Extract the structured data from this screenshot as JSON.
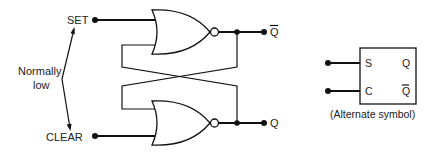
{
  "diagram": {
    "inputs": {
      "set_label": "SET",
      "clear_label": "CLEAR",
      "annotation": [
        "Normally",
        "low"
      ]
    },
    "outputs": {
      "q_bar_label": "Q",
      "q_label": "Q"
    },
    "gates": [
      {
        "type": "NOR",
        "position": "top",
        "inputs": [
          "SET",
          "Q"
        ],
        "output": "Q-bar"
      },
      {
        "type": "NOR",
        "position": "bottom",
        "inputs": [
          "Q-bar",
          "CLEAR"
        ],
        "output": "Q"
      }
    ],
    "alternate_symbol": {
      "left_pins": [
        "S",
        "C"
      ],
      "right_pins": [
        "Q",
        "Q"
      ],
      "right_pin_overbar": [
        false,
        true
      ],
      "caption": "(Alternate symbol)"
    }
  }
}
